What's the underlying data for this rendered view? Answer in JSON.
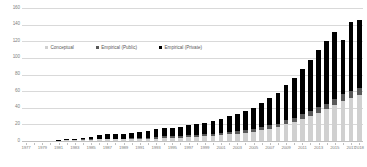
{
  "chart_data": {
    "type": "bar",
    "title": "",
    "subtitle": "",
    "xlabel": "",
    "ylabel": "",
    "ylim": [
      0,
      160
    ],
    "ytick_values": [
      0,
      20,
      40,
      60,
      80,
      100,
      120,
      140,
      160
    ],
    "ytick_labels": [
      "0",
      "20",
      "40",
      "60",
      "80",
      "100",
      "120",
      "140",
      "160"
    ],
    "grid": true,
    "stacked": true,
    "legend_position": "inside-upper-left",
    "x": [
      1977,
      1978,
      1979,
      1980,
      1981,
      1982,
      1983,
      1984,
      1985,
      1986,
      1987,
      1988,
      1989,
      1990,
      1991,
      1992,
      1993,
      1994,
      1995,
      1996,
      1997,
      1998,
      1999,
      2000,
      2001,
      2002,
      2003,
      2004,
      2005,
      2006,
      2007,
      2008,
      2009,
      2010,
      2011,
      2012,
      2013,
      2014,
      2015,
      2016,
      2017,
      2018
    ],
    "xtick_labels": [
      "1977",
      "",
      "1979",
      "",
      "1981",
      "",
      "1983",
      "",
      "1985",
      "",
      "1987",
      "",
      "1989",
      "",
      "1991",
      "",
      "1993",
      "",
      "1995",
      "",
      "1997",
      "",
      "1999",
      "",
      "2001",
      "",
      "2003",
      "",
      "2005",
      "",
      "2007",
      "",
      "2009",
      "",
      "2011",
      "",
      "2013",
      "",
      "2015",
      "",
      "2017",
      "2018"
    ],
    "series": [
      {
        "name": "Conceptual",
        "color": "#d0d0d0",
        "values": [
          0,
          0,
          0,
          0,
          0,
          1,
          1,
          1,
          1,
          2,
          2,
          2,
          2,
          3,
          3,
          3,
          3,
          4,
          4,
          4,
          5,
          5,
          6,
          6,
          7,
          8,
          9,
          10,
          11,
          13,
          15,
          17,
          20,
          23,
          26,
          30,
          34,
          38,
          43,
          48,
          52,
          55
        ]
      },
      {
        "name": "Empirical (Public)",
        "color": "#595959",
        "values": [
          0,
          0,
          0,
          0,
          0,
          0,
          0,
          1,
          1,
          1,
          1,
          1,
          1,
          1,
          1,
          1,
          2,
          2,
          2,
          2,
          2,
          2,
          2,
          2,
          3,
          3,
          3,
          3,
          3,
          4,
          4,
          4,
          5,
          5,
          6,
          6,
          7,
          7,
          8,
          8,
          8,
          9
        ]
      },
      {
        "name": "Empirical (Private)",
        "color": "#000000",
        "values": [
          0,
          0,
          0,
          0,
          1,
          1,
          2,
          2,
          3,
          4,
          5,
          5,
          6,
          6,
          7,
          8,
          9,
          10,
          10,
          11,
          12,
          13,
          14,
          16,
          17,
          19,
          21,
          23,
          26,
          29,
          33,
          37,
          42,
          48,
          55,
          61,
          68,
          75,
          80,
          66,
          83,
          81
        ]
      }
    ],
    "totals": [
      0,
      0,
      0,
      0,
      1,
      2,
      3,
      4,
      5,
      7,
      8,
      8,
      9,
      10,
      11,
      12,
      14,
      16,
      16,
      17,
      19,
      20,
      22,
      24,
      27,
      30,
      33,
      36,
      40,
      46,
      52,
      58,
      67,
      76,
      87,
      97,
      109,
      120,
      131,
      122,
      143,
      145
    ]
  },
  "legend": {
    "items": [
      {
        "label": "Conceptual",
        "swatch_class": "sw-conceptual"
      },
      {
        "label": "Empirical (Public)",
        "swatch_class": "sw-public"
      },
      {
        "label": "Empirical (Private)",
        "swatch_class": "sw-private"
      }
    ]
  }
}
